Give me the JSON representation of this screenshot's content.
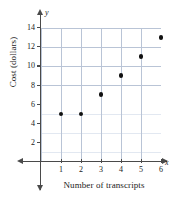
{
  "chart_data": {
    "type": "scatter",
    "title": "",
    "xlabel": "Number of transcripts",
    "ylabel": "Cost (dollars)",
    "x_axis_letter": "x",
    "y_axis_letter": "y",
    "xlim": [
      0,
      6.5
    ],
    "ylim": [
      0,
      14.5
    ],
    "grid": true,
    "grid_minor": true,
    "legend": "none",
    "x_ticks": [
      1,
      2,
      3,
      4,
      5,
      6
    ],
    "y_ticks": [
      2,
      4,
      6,
      8,
      10,
      12,
      14
    ],
    "x_tick_labels": [
      "1",
      "2",
      "3",
      "4",
      "5",
      "6"
    ],
    "y_tick_labels": [
      "2",
      "4",
      "6",
      "8",
      "10",
      "12",
      "14"
    ],
    "x": [
      1,
      2,
      3,
      4,
      5,
      6
    ],
    "values": [
      5,
      5,
      7,
      9,
      11,
      13
    ],
    "points": [
      {
        "x": 1,
        "y": 5
      },
      {
        "x": 2,
        "y": 5
      },
      {
        "x": 3,
        "y": 7
      },
      {
        "x": 4,
        "y": 9
      },
      {
        "x": 5,
        "y": 11
      },
      {
        "x": 6,
        "y": 13
      }
    ],
    "marker": "filled-circle",
    "marker_color": "#111111",
    "grid_major_color": "#b9c4d6",
    "grid_minor_color": "#e2e8f1",
    "axis_color": "#4a4a4a"
  }
}
